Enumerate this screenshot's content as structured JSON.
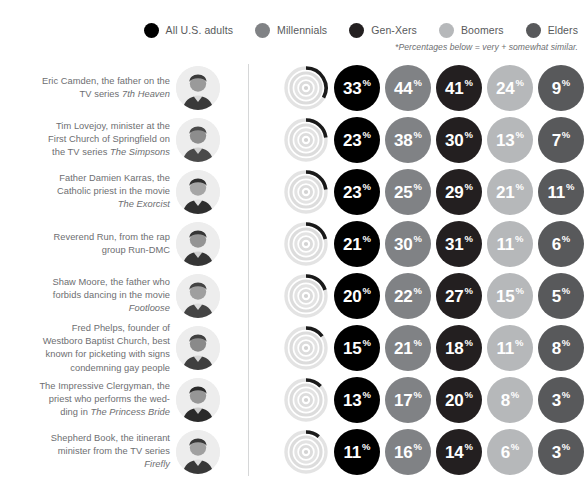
{
  "legend": {
    "items": [
      {
        "label": "All U.S. adults",
        "color": "#000000",
        "key": "all"
      },
      {
        "label": "Millennials",
        "color": "#808285",
        "key": "millennials"
      },
      {
        "label": "Gen-Xers",
        "color": "#231f20",
        "key": "genxers"
      },
      {
        "label": "Boomers",
        "color": "#b6b8ba",
        "key": "boomers"
      },
      {
        "label": "Elders",
        "color": "#58595b",
        "key": "elders"
      }
    ],
    "footnote": "*Percentages below = very + somewhat similar."
  },
  "percent_symbol": "%",
  "chart_data": {
    "type": "bar",
    "title": "",
    "xlabel": "",
    "ylabel": "",
    "legend_position": "top-right",
    "grid": false,
    "note": "*Percentages below = very + somewhat similar.",
    "categories": [
      "Eric Camden, the father on the TV series 7th Heaven",
      "Tim Lovejoy, minister at the First Church of Springfield on the TV series The Simpsons",
      "Father Damien Karras, the Catholic priest in the movie The Exorcist",
      "Reverend Run, from the rap group Run-DMC",
      "Shaw Moore, the father who forbids dancing in the movie Footloose",
      "Fred Phelps, founder of Westboro Baptist Church, best known for picketing with signs condemning gay people",
      "The Impressive Clergyman, the priest who performs the wedding in The Princess Bride",
      "Shepherd Book, the itinerant minister from the TV series Firefly"
    ],
    "series": [
      {
        "name": "All U.S. adults",
        "color": "#000000",
        "values": [
          33,
          23,
          23,
          21,
          20,
          15,
          13,
          11
        ]
      },
      {
        "name": "Millennials",
        "color": "#808285",
        "values": [
          44,
          38,
          25,
          30,
          22,
          21,
          17,
          16
        ]
      },
      {
        "name": "Gen-Xers",
        "color": "#231f20",
        "values": [
          41,
          30,
          29,
          31,
          27,
          18,
          20,
          14
        ]
      },
      {
        "name": "Boomers",
        "color": "#b6b8ba",
        "values": [
          24,
          13,
          21,
          11,
          15,
          11,
          8,
          6
        ]
      },
      {
        "name": "Elders",
        "color": "#58595b",
        "values": [
          9,
          7,
          11,
          6,
          5,
          8,
          3,
          3
        ]
      }
    ],
    "ylim": [
      0,
      100
    ]
  },
  "rows": [
    {
      "label_html": "Eric Camden, the father on the<br>TV series <i>7th Heaven</i>",
      "portrait_name": "portrait-eric-camden",
      "values": [
        33,
        44,
        41,
        24,
        9
      ]
    },
    {
      "label_html": "Tim Lovejoy, minister at the<br>First Church of Springfield on<br>the TV series <i>The Simpsons</i>",
      "portrait_name": "portrait-tim-lovejoy",
      "values": [
        23,
        38,
        30,
        13,
        7
      ]
    },
    {
      "label_html": "Father Damien Karras, the<br>Catholic priest in the movie<br><i>The Exorcist</i>",
      "portrait_name": "portrait-damien-karras",
      "values": [
        23,
        25,
        29,
        21,
        11
      ]
    },
    {
      "label_html": "Reverend Run, from the rap<br>group Run-DMC",
      "portrait_name": "portrait-reverend-run",
      "values": [
        21,
        30,
        31,
        11,
        6
      ]
    },
    {
      "label_html": "Shaw Moore, the father who<br>forbids dancing in the movie<br><i>Footloose</i>",
      "portrait_name": "portrait-shaw-moore",
      "values": [
        20,
        22,
        27,
        15,
        5
      ]
    },
    {
      "label_html": "Fred Phelps, founder of<br>Westboro Baptist Church, best<br>known for picketing with signs<br>condemning gay people",
      "portrait_name": "portrait-fred-phelps",
      "values": [
        15,
        21,
        18,
        11,
        8
      ]
    },
    {
      "label_html": "The Impressive Clergyman, the<br>priest who performs the wed-<br>ding in <i>The Princess Bride</i>",
      "portrait_name": "portrait-impressive-clergyman",
      "values": [
        13,
        17,
        20,
        8,
        3
      ]
    },
    {
      "label_html": "Shepherd Book, the itinerant<br>minister from the TV series<br><i>Firefly</i>",
      "portrait_name": "portrait-shepherd-book",
      "values": [
        11,
        16,
        14,
        6,
        3
      ]
    }
  ]
}
